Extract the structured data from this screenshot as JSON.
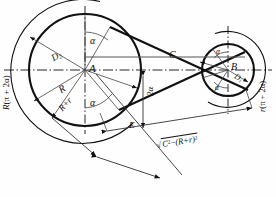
{
  "figure": {
    "type": "engineering-geometry-diagram",
    "background_color": "#fefefe",
    "line_color": "#111111"
  },
  "pulleys": {
    "large": {
      "center_label": "A",
      "center_px": [
        85,
        70
      ],
      "radius_px": 56,
      "outer_arc_radius_px": 72,
      "radius_label": "R",
      "diameter_label": "D",
      "diameter_subscript": "2",
      "arc_label_prefix": "R",
      "arc_label_expr": "(π + 2α)",
      "angle_labels": [
        "α",
        "α"
      ]
    },
    "small": {
      "center_label": "B",
      "center_px": [
        228,
        70
      ],
      "radius_px": 26,
      "outer_arc_radius_px": 38,
      "radius_label": "r",
      "diameter_label": "D",
      "diameter_subscript": "1",
      "arc_label_prefix": "r",
      "arc_label_expr": "(π + 2α)",
      "angle_labels": [
        "α",
        "α"
      ]
    }
  },
  "labels": {
    "center_A": "A",
    "center_B": "B",
    "crossing_point": "C",
    "span_E": "E",
    "radius_R": "R",
    "radius_sum": "R+r",
    "diameter_D2_base": "D",
    "diameter_D2_sub": "2",
    "diameter_D1_base": "D",
    "diameter_D1_sub": "1",
    "alpha": "α",
    "two_alpha": "2α",
    "arc_left_prefix": "R",
    "arc_left_expr": "(π + 2α)",
    "arc_right_prefix": "r",
    "arc_right_expr": "(π + 2α)",
    "formula_radical": "√",
    "formula_C": "C",
    "formula_C_exp": "2",
    "formula_minus": "−",
    "formula_group": "(R+r)",
    "formula_group_exp": "2"
  },
  "annotations": [
    {
      "name": "arc-length-left",
      "text": "R (π + 2α)"
    },
    {
      "name": "arc-length-right",
      "text": "r (π + 2α)"
    },
    {
      "name": "belt-span-length",
      "text": "√(C² − (R+r)²)"
    },
    {
      "name": "center-distance",
      "text": "C"
    },
    {
      "name": "span-label",
      "text": "E"
    },
    {
      "name": "wrap-half-angle",
      "text": "α"
    },
    {
      "name": "wrap-angle",
      "text": "2α"
    }
  ]
}
